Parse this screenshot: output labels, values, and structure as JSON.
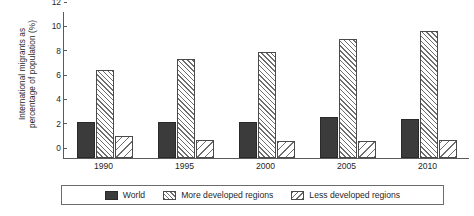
{
  "chart_data": {
    "type": "bar",
    "title": "",
    "xlabel": "",
    "ylabel": "International migrants as percentage of population (%)",
    "ylabel_line1": "International migrants as",
    "ylabel_line2": "percentage of population (%)",
    "categories": [
      "1990",
      "1995",
      "2000",
      "2005",
      "2010"
    ],
    "ylim": [
      0,
      12
    ],
    "yticks": [
      0,
      2,
      4,
      6,
      8,
      10,
      12
    ],
    "ytick_labels": [
      "0",
      "2",
      "4",
      "6",
      "8",
      "10",
      "12"
    ],
    "grid": false,
    "legend_position": "bottom",
    "series": [
      {
        "name": "World",
        "fill": "solid-dark",
        "color": "#3b3b3b",
        "values": [
          3.0,
          3.0,
          3.0,
          3.4,
          3.2
        ]
      },
      {
        "name": "More developed regions",
        "fill": "hatch-forward",
        "color": "#6e6e6e",
        "values": [
          7.2,
          8.1,
          8.7,
          9.8,
          10.4
        ]
      },
      {
        "name": "Less developed regions",
        "fill": "hatch-backward",
        "color": "#6e6e6e",
        "values": [
          1.8,
          1.5,
          1.4,
          1.4,
          1.5
        ]
      }
    ]
  },
  "legend": {
    "items": [
      {
        "label": "World",
        "swatch": "solid-dark-swatch"
      },
      {
        "label": "More developed regions",
        "swatch": "hatch-forward-swatch"
      },
      {
        "label": "Less developed regions",
        "swatch": "hatch-backward-swatch"
      }
    ]
  },
  "colors": {
    "world": "#3b3b3b",
    "hatch": "#6e6e6e",
    "axis": "#5a5a5a",
    "text": "#1f1f1f",
    "background": "#ffffff"
  }
}
